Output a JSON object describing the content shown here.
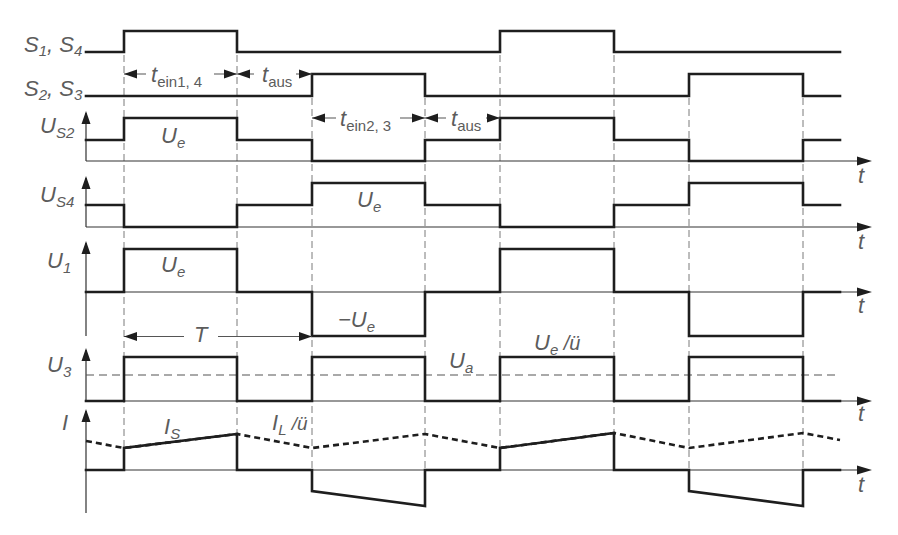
{
  "figure": {
    "type": "timing-diagram",
    "time_axis_label": "t",
    "rows": {
      "s14": {
        "label": {
          "a": "S",
          "a_sub": "1",
          "sep": ", ",
          "b": "S",
          "b_sub": "4"
        },
        "trace": "86,52 124,52 124,31 237,31 237,52 500,52 500,31 614,31 614,52 840,52"
      },
      "s23": {
        "label": {
          "a": "S",
          "a_sub": "2",
          "sep": ", ",
          "b": "S",
          "b_sub": "3"
        },
        "trace": "86,96 312,96 312,74 425,74 425,96 689,96 689,74 803,74 803,96 840,96"
      },
      "us2": {
        "label": {
          "a": "U",
          "a_sub": "S2"
        },
        "trace": "86,140 124,140 124,118 237,118 237,140 312,140 312,161 425,161 425,140 500,140 500,118 614,118 614,140 689,140 689,161 803,161 803,140 840,140",
        "axis": "M86 113 V161 M86 161 H860",
        "arrows": "M86 111 l-4.5 13 h9 z M872 161 l-15 -4.5 v9 z"
      },
      "us4": {
        "label": {
          "a": "U",
          "a_sub": "S4"
        },
        "trace": "86,205 124,205 124,227 237,227 237,205 312,205 312,183 425,183 425,205 500,205 500,227 614,227 614,205 689,205 689,183 803,183 803,205 840,205",
        "axis": "M86 178 V227 M86 227 H860",
        "arrows": "M86 176 l-4.5 13 h9 z M872 227 l-15 -4.5 v9 z"
      },
      "u1": {
        "label": {
          "a": "U",
          "a_sub": "1"
        },
        "trace": "86,292 124,292 124,249 237,249 237,292 312,292 312,336 425,336 425,292 500,292 500,249 614,249 614,292 689,292 689,336 803,336 803,292 840,292",
        "axis": "M86 243 V336 M86 292 H860",
        "arrows": "M86 241 l-4.5 13 h9 z M872 292 l-15 -4.5 v9 z"
      },
      "u3": {
        "label": {
          "a": "U",
          "a_sub": "3"
        },
        "trace": "86,401 124,401 124,357 237,357 237,401 312,401 312,357 425,357 425,401 500,401 500,357 614,357 614,401 689,401 689,357 803,357 803,401 840,401",
        "axis": "M86 350 V401 M86 401 H860",
        "arrows": "M86 348 l-4.5 13 h9 z M872 401 l-15 -4.5 v9 z",
        "ua_level": "M86 375 H840"
      },
      "i": {
        "label": {
          "a": "I"
        },
        "trace": "86,470 124,470 124,448 237,434 237,470 312,470 312,491 425,506 425,470 500,470 500,448 614,433 614,470 689,470 689,491 803,506 803,470 840,470",
        "reflected": "86,441 124,448 237,434 312,448 425,434 500,448 614,433 689,448 803,433 840,440",
        "axis": "M86 411 V513 M86 470 H860",
        "arrows": "M86 409 l-4.5 13 h9 z M872 470 l-15 -4.5 v9 z"
      }
    },
    "annotations": {
      "ue_us2": {
        "a": "U",
        "a_sub": "e"
      },
      "ue_us4": {
        "a": "U",
        "a_sub": "e"
      },
      "ue_u1": {
        "a": "U",
        "a_sub": "e"
      },
      "minus_ue": {
        "a": "−U",
        "a_sub": "e"
      },
      "ua": {
        "a": "U",
        "a_sub": "a"
      },
      "ue_ratio": {
        "a": "U",
        "a_sub": "e",
        "tail": " /ü"
      },
      "period": {
        "a": "T"
      },
      "is": {
        "a": "I",
        "a_sub": "S"
      },
      "il_ratio": {
        "a": "I",
        "a_sub": "L",
        "tail": " /ü"
      }
    },
    "timings": {
      "t_ein14": {
        "a": "t",
        "a_sub": "ein1, 4"
      },
      "t_aus1": {
        "a": "t",
        "a_sub": "aus"
      },
      "t_ein23": {
        "a": "t",
        "a_sub": "ein2, 3"
      },
      "t_aus2": {
        "a": "t",
        "a_sub": "aus"
      }
    },
    "transitions_x": [
      124,
      237,
      312,
      425,
      500,
      614,
      689,
      803
    ],
    "guides": "M124 55 V470 M237 55 V470 M312 98 V470 M425 98 V470 M500 55 V470 M614 55 V470 M689 98 V470 M803 98 V470",
    "dimension_lines": "M124 74 H146 M214 74 H237 M237 74 H254 M296 74 H312 M312 118 H336 M400 118 H425 M425 118 H446 M486 118 H500 M124 336.5 H184 M218 336.5 H312",
    "dimension_arrows": "M124 74 l13 -4.5 v9 z M237 74 l-13 -4.5 v9 z M237 74 l13 -4.5 v9 z M312 74 l-13 -4.5 v9 z M312 118 l13 -4.5 v9 z M425 118 l-13 -4.5 v9 z M425 118 l13 -4.5 v9 z M500 118 l-13 -4.5 v9 z M124 336.5 l13 -4.5 v9 z M312 336.5 l-13 -4.5 v9 z"
  }
}
